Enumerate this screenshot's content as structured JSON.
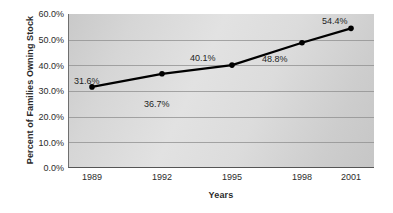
{
  "chart_data": {
    "type": "line",
    "title": "",
    "xlabel": "Years",
    "ylabel": "Percent of Families Owning Stock",
    "categories": [
      "1989",
      "1992",
      "1995",
      "1998",
      "2001"
    ],
    "values": [
      31.6,
      36.7,
      40.1,
      48.8,
      54.4
    ],
    "point_labels": [
      "31.6%",
      "36.7%",
      "40.1%",
      "48.8%",
      "54.4%"
    ],
    "ylim": [
      0,
      60
    ],
    "y_ticks": [
      0,
      10,
      20,
      30,
      40,
      50,
      60
    ],
    "y_tick_labels": [
      "0.0%",
      "10.0%",
      "20.0%",
      "30.0%",
      "40.0%",
      "50.0%",
      "60.0%"
    ],
    "grid": true,
    "legend": "none",
    "series": [
      {
        "name": "Percent of Families Owning Stock",
        "values": [
          31.6,
          36.7,
          40.1,
          48.8,
          54.4
        ],
        "line_color": "#000000",
        "marker_color": "#000000"
      }
    ],
    "colors": {
      "plot_background": "#d9d9d9",
      "gridline": "#8d8d8d",
      "axis": "#555555",
      "text": "#2b2b2b",
      "figure_background": "#ffffff"
    }
  }
}
